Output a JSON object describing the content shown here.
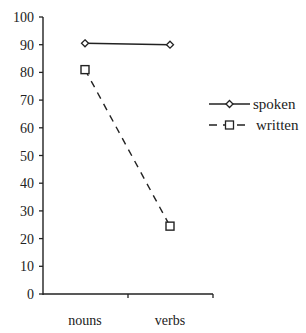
{
  "chart_data": {
    "type": "line",
    "title": "",
    "xlabel": "",
    "ylabel": "",
    "categories": [
      "nouns",
      "verbs"
    ],
    "series": [
      {
        "name": "spoken",
        "values": [
          90.5,
          90
        ],
        "marker": "diamond",
        "line_style": "solid"
      },
      {
        "name": "written",
        "values": [
          81,
          24.5
        ],
        "marker": "square",
        "line_style": "dashed"
      }
    ],
    "ylim": [
      0,
      100
    ],
    "yticks": [
      0,
      10,
      20,
      30,
      40,
      50,
      60,
      70,
      80,
      90,
      100
    ],
    "grid": false,
    "legend_position": "right"
  },
  "legend": {
    "spoken_label": "spoken",
    "written_label": "written"
  },
  "axis": {
    "y_tick_labels": [
      "0",
      "10",
      "20",
      "30",
      "40",
      "50",
      "60",
      "70",
      "80",
      "90",
      "100"
    ],
    "x_labels": [
      "nouns",
      "verbs"
    ]
  },
  "colors": {
    "ink": "#222222",
    "background": "#ffffff"
  }
}
